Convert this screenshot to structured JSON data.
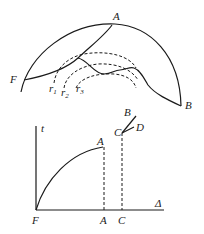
{
  "top_figure": {
    "labels": {
      "A": "A",
      "F": "F",
      "B": "B",
      "r1": "r",
      "r1_sub": "1",
      "r2": "r",
      "r2_sub": "2",
      "r3": "r",
      "r3_sub": "3"
    }
  },
  "bottom_figure": {
    "y_axis_label": "t",
    "x_axis_label": "Δ",
    "origin_label": "F",
    "x_tick_labels": [
      "A",
      "C"
    ],
    "point_labels": {
      "A": "A",
      "C": "C",
      "B": "B",
      "D": "D"
    }
  }
}
